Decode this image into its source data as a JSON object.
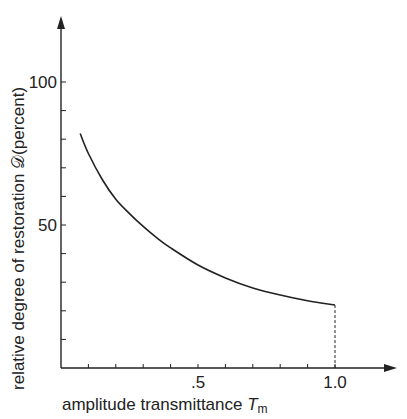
{
  "chart_data": {
    "type": "line",
    "title": "",
    "xlabel": "amplitude transmittance T_m",
    "xlabel_main": "amplitude transmittance ",
    "xlabel_symbol": "T",
    "xlabel_sub": "m",
    "ylabel": "relative degree of restoration 𝒟(percent)",
    "xlim": [
      0,
      1.15
    ],
    "ylim": [
      0,
      120
    ],
    "x_ticks": [
      0.1,
      0.2,
      0.3,
      0.4,
      0.5,
      0.6,
      0.7,
      0.8,
      0.9,
      1.0
    ],
    "x_tick_labels": [
      ".5",
      "1.0"
    ],
    "y_ticks": [
      10,
      20,
      30,
      40,
      50,
      60,
      70,
      80,
      90,
      100
    ],
    "y_tick_labels": [
      "50",
      "100"
    ],
    "grid": false,
    "legend": null,
    "series": [
      {
        "name": "degree of restoration",
        "x": [
          0.07,
          0.1,
          0.15,
          0.2,
          0.25,
          0.3,
          0.35,
          0.4,
          0.5,
          0.6,
          0.7,
          0.8,
          0.9,
          1.0
        ],
        "values": [
          82,
          75,
          66,
          59,
          54,
          49.5,
          45.5,
          42,
          36,
          31.5,
          28,
          25.5,
          23.5,
          22
        ]
      }
    ],
    "annotations": [
      {
        "type": "dashed-vertical",
        "x": 1.0,
        "from": 0,
        "to": 22
      }
    ]
  }
}
